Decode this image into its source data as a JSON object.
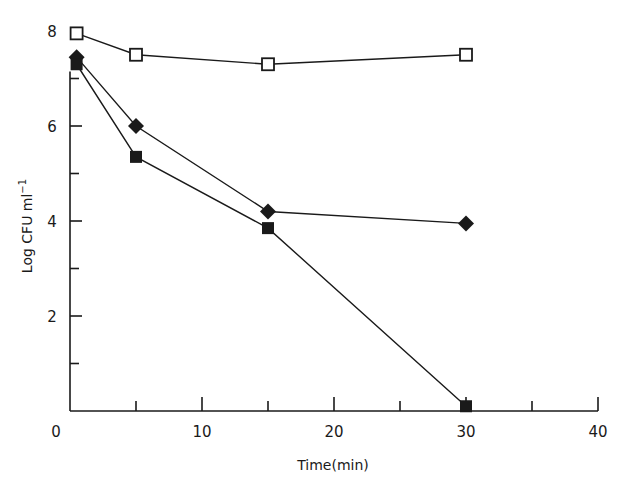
{
  "chart_data": {
    "type": "line",
    "title": "",
    "xlabel": "Time(min)",
    "ylabel": "Log CFU ml⁻¹",
    "xlim": [
      0,
      40
    ],
    "ylim": [
      0,
      8
    ],
    "x_ticks": [
      0,
      10,
      20,
      30,
      40
    ],
    "x_minor_ticks": [
      5,
      15,
      25,
      35
    ],
    "y_ticks": [
      2,
      4,
      6,
      8
    ],
    "y_minor_ticks": [
      1,
      3,
      5,
      7
    ],
    "grid": false,
    "legend": null,
    "x": [
      0.5,
      5,
      15,
      30
    ],
    "series": [
      {
        "name": "open-square",
        "marker": "open-square",
        "values": [
          7.95,
          7.5,
          7.3,
          7.5
        ]
      },
      {
        "name": "filled-diamond",
        "marker": "filled-diamond",
        "values": [
          7.45,
          6.0,
          4.2,
          3.95
        ]
      },
      {
        "name": "filled-square",
        "marker": "filled-square",
        "values": [
          7.3,
          5.35,
          3.85,
          0.1
        ]
      }
    ]
  },
  "axes": {
    "x_tick_labels": [
      "0",
      "10",
      "20",
      "30",
      "40"
    ],
    "y_tick_labels": [
      "2",
      "4",
      "6",
      "8"
    ],
    "x_title": "Time(min)",
    "y_title_main": "Log CFU ml",
    "y_title_sup": "−1"
  },
  "colors": {
    "ink": "#1a1a1a",
    "background": "#ffffff"
  }
}
